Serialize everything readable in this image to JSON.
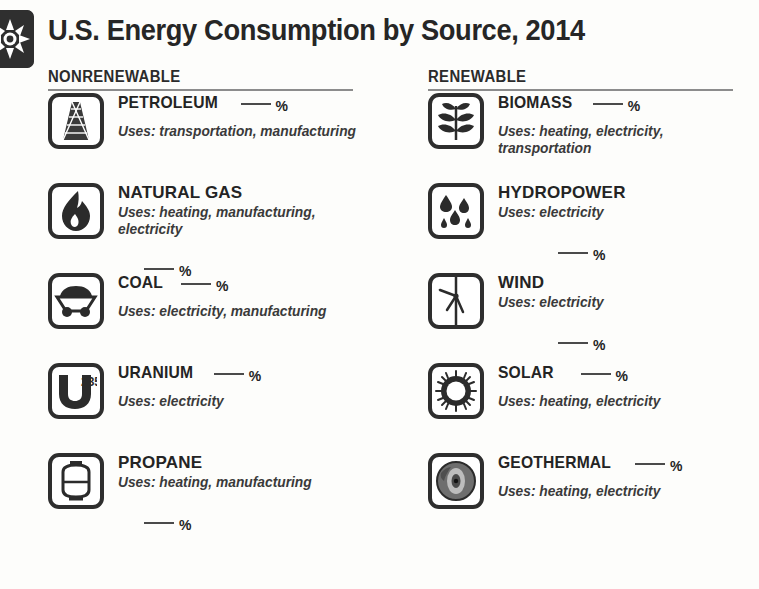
{
  "header": {
    "title": "U.S. Energy Consumption by Source, 2014",
    "logo_icon": "eia-sunburst-logo-icon"
  },
  "columns": [
    {
      "id": "nonrenewable",
      "heading": "NONRENEWABLE",
      "items": [
        {
          "name": "PETROLEUM",
          "icon": "oil-derrick-icon",
          "percent_blank": "___",
          "percent_symbol": "%",
          "uses": "Uses: transportation, manufacturing"
        },
        {
          "name": "NATURAL GAS",
          "icon": "flame-icon",
          "percent_blank": "___",
          "percent_symbol": "%",
          "uses": "Uses: heating, manufacturing, electricity"
        },
        {
          "name": "COAL",
          "icon": "coal-cart-icon",
          "percent_blank": "___",
          "percent_symbol": "%",
          "uses": "Uses: electricity, manufacturing"
        },
        {
          "name": "URANIUM",
          "icon": "uranium-u235-icon",
          "percent_blank": "___",
          "percent_symbol": "%",
          "uses": "Uses: electricity"
        },
        {
          "name": "PROPANE",
          "icon": "propane-tank-icon",
          "percent_blank": "___",
          "percent_symbol": "%",
          "uses": "Uses: heating, manufacturing"
        }
      ]
    },
    {
      "id": "renewable",
      "heading": "RENEWABLE",
      "items": [
        {
          "name": "BIOMASS",
          "icon": "plant-leaves-icon",
          "percent_blank": "___",
          "percent_symbol": "%",
          "uses": "Uses: heating, electricity, transportation"
        },
        {
          "name": "HYDROPOWER",
          "icon": "water-droplets-icon",
          "percent_blank": "___",
          "percent_symbol": "%",
          "uses": "Uses: electricity"
        },
        {
          "name": "WIND",
          "icon": "wind-turbine-icon",
          "percent_blank": "___",
          "percent_symbol": "%",
          "uses": "Uses: electricity"
        },
        {
          "name": "SOLAR",
          "icon": "sun-icon",
          "percent_blank": "___",
          "percent_symbol": "%",
          "uses": "Uses: heating, electricity"
        },
        {
          "name": "GEOTHERMAL",
          "icon": "earth-cross-section-icon",
          "percent_blank": "___",
          "percent_symbol": "%",
          "uses": "Uses: heating, electricity"
        }
      ]
    }
  ],
  "colors": {
    "background": "#fdfdfb",
    "ink": "#262626",
    "rule": "#8c8c8c",
    "icon_stroke": "#2e2e2e"
  }
}
